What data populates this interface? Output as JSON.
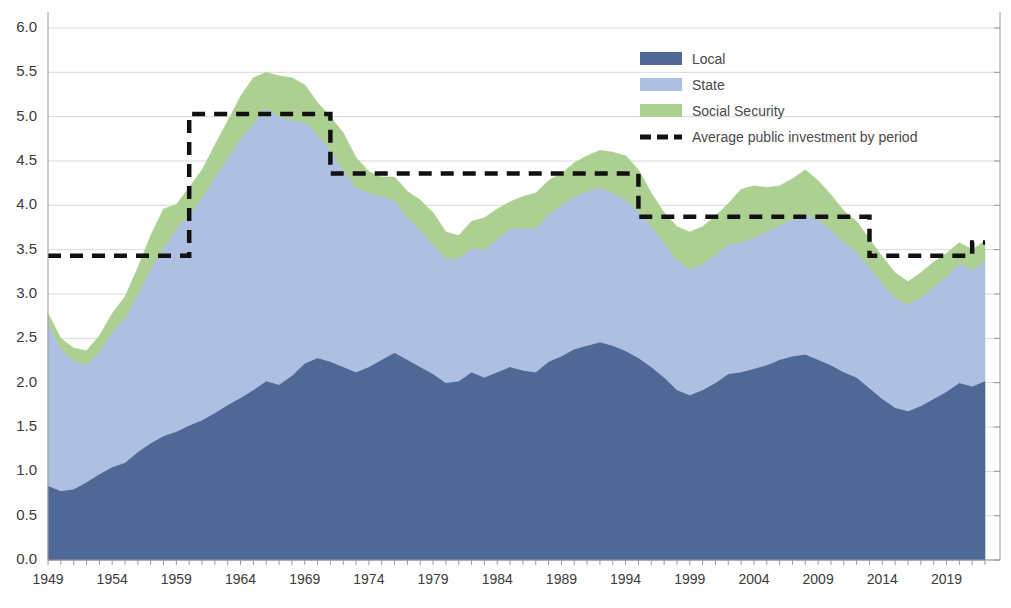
{
  "chart_data": {
    "type": "area",
    "stacked": true,
    "title": "",
    "subtitle": "",
    "xlabel": "",
    "ylabel": "",
    "xlim": [
      1949,
      2022
    ],
    "ylim": [
      0.0,
      6.0
    ],
    "ytick_step": 0.5,
    "grid": true,
    "legend_position": "top-right",
    "x": [
      1949,
      1950,
      1951,
      1952,
      1953,
      1954,
      1955,
      1956,
      1957,
      1958,
      1959,
      1960,
      1961,
      1962,
      1963,
      1964,
      1965,
      1966,
      1967,
      1968,
      1969,
      1970,
      1971,
      1972,
      1973,
      1974,
      1975,
      1976,
      1977,
      1978,
      1979,
      1980,
      1981,
      1982,
      1983,
      1984,
      1985,
      1986,
      1987,
      1988,
      1989,
      1990,
      1991,
      1992,
      1993,
      1994,
      1995,
      1996,
      1997,
      1998,
      1999,
      2000,
      2001,
      2002,
      2003,
      2004,
      2005,
      2006,
      2007,
      2008,
      2009,
      2010,
      2011,
      2012,
      2013,
      2014,
      2015,
      2016,
      2017,
      2018,
      2019,
      2020,
      2021,
      2022
    ],
    "tick_labels": [
      "1949",
      "1954",
      "1959",
      "1964",
      "1969",
      "1974",
      "1979",
      "1984",
      "1989",
      "1994",
      "1999",
      "2004",
      "2009",
      "2014",
      "2019"
    ],
    "ytick_labels": [
      "0.0",
      "0.5",
      "1.0",
      "1.5",
      "2.0",
      "2.5",
      "3.0",
      "3.5",
      "4.0",
      "4.5",
      "5.0",
      "5.5",
      "6.0"
    ],
    "series": [
      {
        "name": "Local",
        "color": "#4f6896",
        "values": [
          0.84,
          0.78,
          0.8,
          0.88,
          0.97,
          1.05,
          1.1,
          1.22,
          1.32,
          1.4,
          1.45,
          1.52,
          1.58,
          1.66,
          1.75,
          1.83,
          1.92,
          2.02,
          1.98,
          2.08,
          2.22,
          2.28,
          2.24,
          2.18,
          2.12,
          2.18,
          2.26,
          2.34,
          2.26,
          2.18,
          2.1,
          2.0,
          2.02,
          2.12,
          2.06,
          2.12,
          2.18,
          2.14,
          2.12,
          2.24,
          2.3,
          2.38,
          2.42,
          2.46,
          2.42,
          2.36,
          2.28,
          2.18,
          2.06,
          1.92,
          1.86,
          1.92,
          2.0,
          2.1,
          2.12,
          2.16,
          2.2,
          2.26,
          2.3,
          2.32,
          2.26,
          2.2,
          2.12,
          2.06,
          1.94,
          1.82,
          1.72,
          1.68,
          1.74,
          1.82,
          1.9,
          2.0,
          1.96,
          2.02
        ]
      },
      {
        "name": "State",
        "color": "#aec0e2",
        "values": [
          1.83,
          1.6,
          1.45,
          1.32,
          1.38,
          1.52,
          1.63,
          1.78,
          1.96,
          2.12,
          2.28,
          2.38,
          2.5,
          2.66,
          2.78,
          2.92,
          3.0,
          3.08,
          3.02,
          2.88,
          2.72,
          2.52,
          2.38,
          2.22,
          2.08,
          1.96,
          1.84,
          1.72,
          1.6,
          1.54,
          1.46,
          1.4,
          1.38,
          1.4,
          1.44,
          1.5,
          1.56,
          1.6,
          1.62,
          1.66,
          1.7,
          1.72,
          1.74,
          1.74,
          1.72,
          1.7,
          1.66,
          1.58,
          1.52,
          1.46,
          1.42,
          1.42,
          1.44,
          1.46,
          1.46,
          1.48,
          1.5,
          1.52,
          1.54,
          1.58,
          1.58,
          1.52,
          1.46,
          1.42,
          1.36,
          1.3,
          1.24,
          1.2,
          1.22,
          1.26,
          1.3,
          1.34,
          1.32,
          1.34
        ]
      },
      {
        "name": "Social Security",
        "color": "#acd092",
        "values": [
          0.11,
          0.12,
          0.14,
          0.16,
          0.18,
          0.21,
          0.24,
          0.3,
          0.38,
          0.44,
          0.28,
          0.3,
          0.32,
          0.36,
          0.42,
          0.48,
          0.52,
          0.4,
          0.46,
          0.48,
          0.42,
          0.36,
          0.38,
          0.42,
          0.34,
          0.24,
          0.22,
          0.26,
          0.3,
          0.34,
          0.36,
          0.3,
          0.26,
          0.3,
          0.36,
          0.34,
          0.3,
          0.36,
          0.4,
          0.38,
          0.36,
          0.38,
          0.4,
          0.42,
          0.46,
          0.5,
          0.46,
          0.38,
          0.34,
          0.38,
          0.42,
          0.42,
          0.44,
          0.46,
          0.6,
          0.58,
          0.5,
          0.44,
          0.46,
          0.5,
          0.44,
          0.4,
          0.36,
          0.34,
          0.32,
          0.3,
          0.28,
          0.26,
          0.28,
          0.28,
          0.26,
          0.24,
          0.22,
          0.24
        ]
      }
    ],
    "average_line": {
      "name": "Average public investment by period",
      "color": "#111111",
      "style": "dashed",
      "segments": [
        {
          "start": 1949,
          "end": 1960,
          "value": 3.43
        },
        {
          "start": 1960,
          "end": 1971,
          "value": 5.03
        },
        {
          "start": 1971,
          "end": 1995,
          "value": 4.36
        },
        {
          "start": 1995,
          "end": 2013,
          "value": 3.87
        },
        {
          "start": 2013,
          "end": 2021,
          "value": 3.43
        },
        {
          "start": 2021,
          "end": 2022,
          "value": 3.58
        }
      ]
    },
    "legend": [
      {
        "label": "Local",
        "color": "#4f6896",
        "marker": "swatch"
      },
      {
        "label": "State",
        "color": "#aec0e2",
        "marker": "swatch"
      },
      {
        "label": "Social Security",
        "color": "#acd092",
        "marker": "swatch"
      },
      {
        "label": "Average public investment by period",
        "color": "#111111",
        "marker": "dashed-line"
      }
    ]
  },
  "axes": {
    "y_min_label": "0.0",
    "y_max_label": "6.0"
  }
}
